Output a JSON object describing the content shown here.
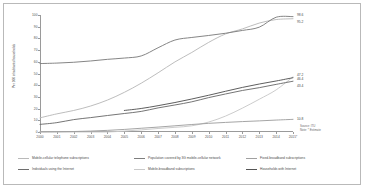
{
  "chart_data": {
    "type": "line",
    "title": "",
    "xlabel": "",
    "ylabel": "Per 100 inhabitants/households",
    "x": [
      "2000",
      "2001",
      "2002",
      "2003",
      "2004",
      "2005",
      "2006",
      "2007",
      "2008",
      "2009",
      "2010",
      "2011",
      "2012",
      "2013",
      "2014",
      "2015*"
    ],
    "xlim": [
      2000,
      2015
    ],
    "ylim": [
      0,
      100
    ],
    "yticks": [
      "0",
      "10",
      "20",
      "30",
      "40",
      "50",
      "60",
      "70",
      "80",
      "90",
      "100"
    ],
    "grid": false,
    "legend_position": "bottom",
    "series": [
      {
        "name": "Mobile-cellular telephone subscriptions",
        "color": "#b9b9b9",
        "end_label": "",
        "values": [
          12.1,
          15.5,
          18.4,
          22.2,
          27.3,
          33.9,
          41.7,
          50.6,
          59.9,
          68.0,
          76.6,
          83.8,
          88.1,
          93.1,
          96.1,
          96.8
        ]
      },
      {
        "name": "Mobile-broadband subscriptions",
        "color": "#c9c9c9",
        "end_label": "",
        "values": [
          0.0,
          0.0,
          0.0,
          0.0,
          0.0,
          0.8,
          1.8,
          3.0,
          4.0,
          5.3,
          8.5,
          13.6,
          20.4,
          28.0,
          36.0,
          47.2
        ]
      },
      {
        "name": "Individuals using the Internet",
        "color": "#6e6e6e",
        "end_label": "43.4",
        "values": [
          6.5,
          8.0,
          10.6,
          12.3,
          14.1,
          15.8,
          17.6,
          20.6,
          23.1,
          25.8,
          29.4,
          32.5,
          35.5,
          37.9,
          40.7,
          43.4
        ]
      },
      {
        "name": "Fixed-broadband subscriptions",
        "color": "#a0a0a0",
        "end_label": "10.8",
        "values": [
          0.1,
          0.2,
          0.4,
          0.8,
          1.4,
          2.2,
          3.2,
          4.2,
          5.3,
          6.4,
          7.4,
          8.2,
          8.9,
          9.5,
          10.2,
          10.8
        ]
      },
      {
        "name": "Population covered by 3G mobile-cellular network",
        "color": "#7e7e7e",
        "end_label": "98.6",
        "values": [
          58.5,
          58.9,
          59.6,
          60.7,
          62.1,
          63.2,
          65.0,
          72.0,
          78.6,
          80.8,
          82.5,
          84.4,
          86.8,
          89.6,
          98.1,
          98.6
        ]
      },
      {
        "name": "Households with Internet",
        "color": "#555555",
        "end_label": "46.4",
        "values": [
          null,
          null,
          null,
          null,
          null,
          18.4,
          20.1,
          22.5,
          25.2,
          28.2,
          31.4,
          34.8,
          38.1,
          41.0,
          43.6,
          46.4
        ]
      }
    ],
    "annotations": [
      {
        "label": "98.6",
        "value": 98.6
      },
      {
        "label": "95.2",
        "value": 95.2
      },
      {
        "label": "47.2",
        "value": 47.2
      },
      {
        "label": "46.4",
        "value": 46.4
      },
      {
        "label": "43.4",
        "value": 43.4
      },
      {
        "label": "10.8",
        "value": 10.8
      }
    ]
  },
  "notes": {
    "source": "Source: ITU",
    "note": "Note: * Estimate"
  },
  "legend": [
    {
      "label": "Mobile-cellular telephone subscriptions",
      "color": "#b9b9b9"
    },
    {
      "label": "Individuals using the Internet",
      "color": "#6e6e6e"
    },
    {
      "label": "Population covered by 3G mobile-cellular network",
      "color": "#7e7e7e"
    },
    {
      "label": "Mobile-broadband subscriptions",
      "color": "#c9c9c9"
    },
    {
      "label": "Fixed-broadband subscriptions",
      "color": "#a0a0a0"
    },
    {
      "label": "Households with Internet",
      "color": "#555555"
    }
  ]
}
